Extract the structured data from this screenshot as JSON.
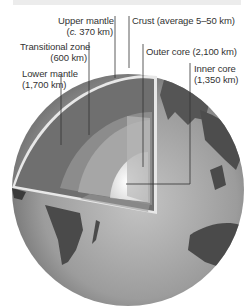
{
  "diagram": {
    "labels": {
      "upper_mantle": {
        "name": "Upper mantle",
        "size": "(c. 370 km)"
      },
      "transitional_zone": {
        "name": "Transitional zone",
        "size": "(600 km)"
      },
      "lower_mantle": {
        "name": "Lower mantle",
        "size": "(1,700 km)"
      },
      "crust": {
        "name": "Crust (average 5–50 km)"
      },
      "outer_core": {
        "name": "Outer core (2,100 km)"
      },
      "inner_core": {
        "name": "Inner core",
        "size": "(1,350 km)"
      }
    },
    "colors": {
      "ocean": "#9a9a9a",
      "land": "#4a4a4a",
      "lower_mantle": "#6e6e6e",
      "outer_core": "#a8a8a8",
      "inner_core": "#f2f2f2",
      "crust_edge": "#e6e6e6"
    }
  }
}
